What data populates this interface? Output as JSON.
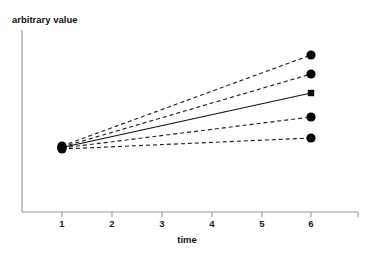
{
  "chart_data": {
    "type": "line",
    "title": "",
    "xlabel": "time",
    "ylabel": "arbitrary value",
    "grid": false,
    "legend": "none",
    "xticks": [
      "1",
      "2",
      "3",
      "4",
      "5",
      "6"
    ],
    "xtick_values": [
      1,
      2,
      3,
      4,
      5,
      6
    ],
    "xlim": [
      0.5,
      6.95
    ],
    "ylim": [
      0,
      100
    ],
    "yticks": [],
    "x": [
      1,
      6
    ],
    "series": [
      {
        "name": "trajectory-1",
        "style": "dashed",
        "marker": "circle",
        "values": [
          20.8,
          84.5
        ]
      },
      {
        "name": "trajectory-2",
        "style": "dashed",
        "marker": "circle",
        "values": [
          20.2,
          73.5
        ]
      },
      {
        "name": "trajectory-3",
        "style": "solid",
        "marker": "square",
        "values": [
          19.6,
          62.4
        ]
      },
      {
        "name": "trajectory-4",
        "style": "dashed",
        "marker": "circle",
        "values": [
          19.0,
          50.5
        ]
      },
      {
        "name": "trajectory-5",
        "style": "dashed",
        "marker": "circle",
        "values": [
          18.4,
          39.0
        ]
      }
    ],
    "annotations": []
  },
  "geometry": {
    "axis_origin_x": 22,
    "axis_origin_y": 212,
    "axis_top_y": 30,
    "axis_right_x": 358,
    "x_pixels": {
      "1": 62,
      "2": 112,
      "3": 162,
      "4": 212,
      "5": 262,
      "6": 311
    },
    "left_cluster_y": [
      146,
      147,
      147.5,
      148,
      149
    ],
    "right_marker_y": [
      55,
      74,
      93,
      117,
      138
    ],
    "circle_radius": 4.6,
    "square_size": 6.4,
    "ylabel_pos": {
      "x": 12,
      "y": 23
    },
    "xlabel_pos": {
      "x": 187,
      "y": 243
    },
    "tick_label_y": 227,
    "tick_len": 5
  },
  "colors": {
    "background": "#ffffff",
    "axis": "#9a9a9a",
    "marker": "#050505",
    "solid_line": "#111111",
    "dashed_line": "#222222",
    "text": "#111111"
  }
}
